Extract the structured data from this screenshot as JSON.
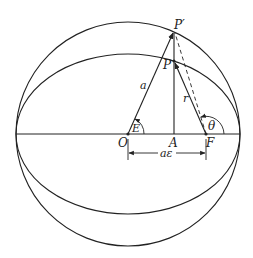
{
  "diagram": {
    "type": "geometric-construction",
    "colors": {
      "stroke": "#222222",
      "background": "#ffffff"
    },
    "geometry": {
      "center": {
        "x": 128,
        "y": 134
      },
      "circle_radius": 112,
      "ellipse_rx": 112,
      "ellipse_ry": 80,
      "focus_x": 206,
      "point_x": 174,
      "p_prime_y": 32,
      "p_y": 61
    },
    "labels": {
      "p_prime": "P′",
      "p": "P",
      "a": "a",
      "r": "r",
      "E": "E",
      "theta": "θ",
      "O": "O",
      "A": "A",
      "F": "F",
      "a_epsilon": "aε"
    }
  }
}
